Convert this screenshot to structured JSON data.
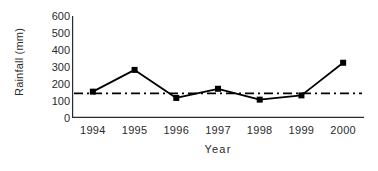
{
  "chart_data": {
    "type": "line",
    "title": "",
    "xlabel": "Year",
    "ylabel": "Rainfall (mm)",
    "categories": [
      "1994",
      "1995",
      "1996",
      "1997",
      "1998",
      "1999",
      "2000"
    ],
    "values": [
      155,
      283,
      118,
      172,
      108,
      133,
      325
    ],
    "series": [
      {
        "name": "Rainfall",
        "values": [
          155,
          283,
          118,
          172,
          108,
          133,
          325
        ],
        "marker": "square",
        "color": "#000000"
      }
    ],
    "reference_line": {
      "label": "mean",
      "value": 145,
      "style": "dash-dot",
      "color": "#000000"
    },
    "ylim": [
      0,
      600
    ],
    "ytick_values": [
      0,
      100,
      200,
      300,
      400,
      500,
      600
    ],
    "ytick_labels": [
      "0",
      "100",
      "200",
      "300",
      "400",
      "500",
      "600"
    ],
    "grid": false,
    "legend": false,
    "axis_color": "#2b2b2b"
  }
}
